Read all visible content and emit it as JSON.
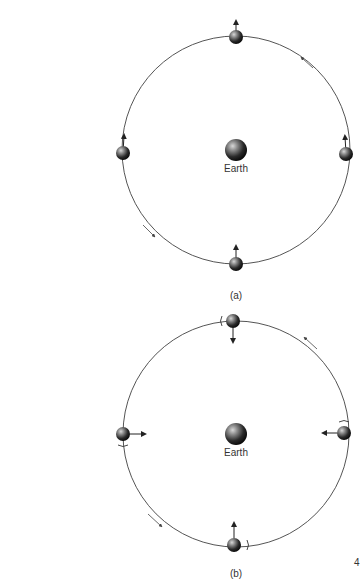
{
  "diagrams": [
    {
      "id": "a",
      "caption": "(a)",
      "center_label": "Earth",
      "center": [
        236,
        150
      ],
      "radius": 114,
      "description": "Moon orbiting Earth without rotation; arrow on moon always points up (same direction)",
      "moons": [
        {
          "position": "top",
          "arrow": "up"
        },
        {
          "position": "left",
          "arrow": "up"
        },
        {
          "position": "right",
          "arrow": "up"
        },
        {
          "position": "bottom",
          "arrow": "up"
        }
      ],
      "orbit_direction": "counterclockwise"
    },
    {
      "id": "b",
      "caption": "(b)",
      "center_label": "Earth",
      "center": [
        236,
        434
      ],
      "radius": 113,
      "description": "Moon orbiting Earth with synchronous rotation; arrow on moon always points toward Earth",
      "moons": [
        {
          "position": "top",
          "arrow": "down"
        },
        {
          "position": "left",
          "arrow": "right"
        },
        {
          "position": "right",
          "arrow": "left"
        },
        {
          "position": "bottom",
          "arrow": "up"
        }
      ],
      "orbit_direction": "counterclockwise"
    }
  ],
  "page_number": "4"
}
